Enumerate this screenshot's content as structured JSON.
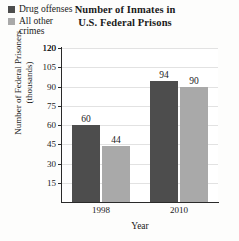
{
  "chart_data": {
    "type": "bar",
    "title": "Number of Inmates in U.S. Federal Prisons",
    "title_lines": [
      "Number of Inmates in",
      "U.S. Federal Prisons"
    ],
    "xlabel": "Year",
    "ylabel": "Number of Federal Prisoners (thousands)",
    "ylabel_lines": [
      "Number of Federal Prisoners",
      "(thousands)"
    ],
    "categories": [
      "1998",
      "2010"
    ],
    "yticks": [
      15,
      30,
      45,
      60,
      75,
      90,
      105,
      120
    ],
    "ytick_labels": [
      "15",
      "30",
      "45",
      "60",
      "75",
      "90",
      "105",
      "120"
    ],
    "ylim": [
      0,
      120
    ],
    "grid": true,
    "legend_position": "upper-left",
    "series": [
      {
        "name": "Drug offenses",
        "color": "#4d4d4d",
        "values": [
          60,
          94
        ],
        "value_labels": [
          "60",
          "94"
        ]
      },
      {
        "name": "All other crimes",
        "name_lines": [
          "All other",
          "crimes"
        ],
        "color": "#a9a9a9",
        "values": [
          44,
          90
        ],
        "value_labels": [
          "44",
          "90"
        ]
      }
    ]
  },
  "legend": {
    "items": [
      {
        "label": "Drug offenses",
        "line1": "Drug offenses",
        "line2": "",
        "color": "#4d4d4d"
      },
      {
        "label": "All other crimes",
        "line1": "All other",
        "line2": "crimes",
        "color": "#a9a9a9"
      }
    ]
  },
  "colors": {
    "axis": "#2a2a2a",
    "grid": "#e2e2e2",
    "background": "#fdfdfc",
    "text": "#1a1a1a"
  }
}
